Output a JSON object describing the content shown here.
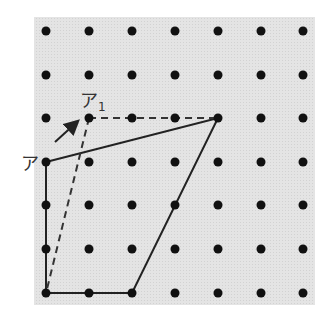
{
  "figure": {
    "panel": {
      "x": 34,
      "y": 17,
      "width": 281,
      "height": 288,
      "fill": "#e2e2e2"
    },
    "grid": {
      "columns_x": [
        46,
        89,
        132,
        175,
        218,
        261,
        303
      ],
      "rows_y": [
        31,
        75,
        118,
        162,
        205,
        249,
        293
      ],
      "dot_radius": 4.5,
      "dot_color": "#111111"
    },
    "solid_polygon": {
      "points": [
        [
          46,
          162
        ],
        [
          218,
          118
        ],
        [
          132,
          293
        ],
        [
          46,
          293
        ]
      ],
      "stroke": "#222222",
      "note": "quadrilateral drawn with solid lines"
    },
    "dashed_lines": [
      {
        "from": [
          89,
          118
        ],
        "to": [
          218,
          118
        ]
      },
      {
        "from": [
          89,
          118
        ],
        "to": [
          46,
          293
        ]
      }
    ],
    "arrow": {
      "from": [
        55,
        142
      ],
      "to": [
        79,
        120
      ]
    },
    "labels": {
      "point_a": "ア",
      "point_a1_main": "ア",
      "point_a1_sub": "1"
    }
  }
}
